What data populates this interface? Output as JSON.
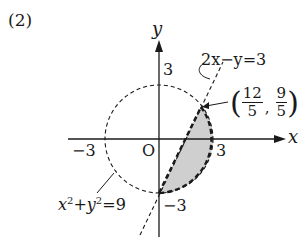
{
  "problem_label": "(2)",
  "axes": {
    "x_label": "x",
    "y_label": "y",
    "origin_label": "O",
    "ticks": {
      "x_neg": "−3",
      "x_pos": "3",
      "y_pos": "3",
      "y_neg": "−3"
    }
  },
  "circle": {
    "equation": "x²+y²=9",
    "eq_lhs_x": "x",
    "eq_lhs_y": "y",
    "eq_exp": "2",
    "eq_plus": "+",
    "eq_rhs": "=9",
    "style": "dashed",
    "radius": 3
  },
  "line": {
    "equation": "2x−y=3",
    "style": "dashed"
  },
  "intersection_point": {
    "label": "(12/5, 9/5)",
    "x_num": "12",
    "x_den": "5",
    "y_num": "9",
    "y_den": "5",
    "open_paren": "(",
    "close_paren": ")",
    "comma": ","
  },
  "shaded_region": {
    "description": "Region inside circle x²+y²<9 and right of line 2x−y>3",
    "fill_color": "#cfcfcf"
  },
  "colors": {
    "stroke": "#1a1a1a",
    "shade": "#cfcfcf",
    "background": "#ffffff"
  }
}
